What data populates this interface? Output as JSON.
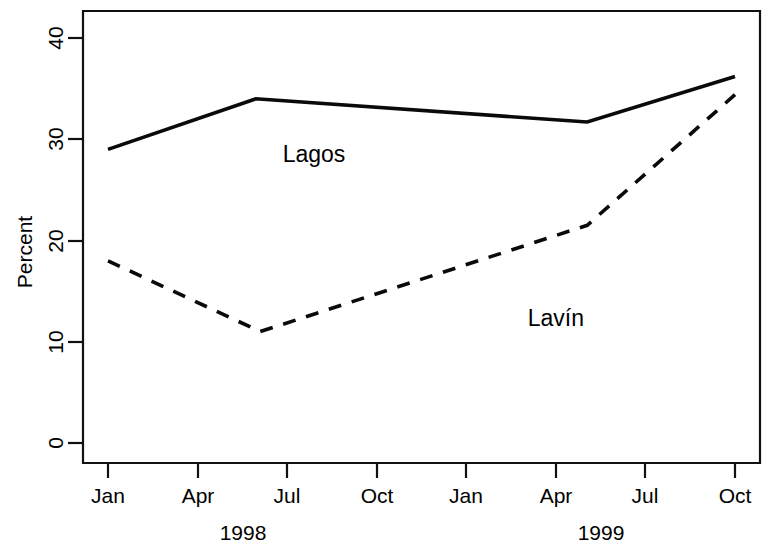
{
  "chart_data": {
    "type": "line",
    "title": "",
    "subtitle": "",
    "xlabel": "",
    "ylabel": "Percent",
    "ylim": [
      0,
      40
    ],
    "yticks": [
      0,
      10,
      20,
      30,
      40
    ],
    "ytick_labels": [
      "0",
      "10",
      "20",
      "30",
      "40"
    ],
    "x": [
      "Jan",
      "Apr",
      "Jul",
      "Oct",
      "Jan",
      "Apr",
      "Jul",
      "Oct"
    ],
    "xtick_labels": [
      "Jan",
      "Apr",
      "Jul",
      "Oct",
      "Jan",
      "Apr",
      "Jul",
      "Oct"
    ],
    "x_group_labels": [
      {
        "label": "1998",
        "center_tick_index": 1.5
      },
      {
        "label": "1999",
        "center_tick_index": 5.5
      }
    ],
    "grid": false,
    "legend": "inline-annotations",
    "series": [
      {
        "name": "Lagos",
        "style": "solid",
        "color": "#0a0a0a",
        "points": [
          {
            "x_label": "Jan 1998",
            "x_index": 0.0,
            "value": 29.0
          },
          {
            "x_label": "Jun 1998",
            "x_index": 1.65,
            "value": 34.0
          },
          {
            "x_label": "May 1999",
            "x_index": 5.35,
            "value": 31.7
          },
          {
            "x_label": "Oct 1999",
            "x_index": 7.0,
            "value": 36.2
          }
        ]
      },
      {
        "name": "Lavín",
        "style": "dashed",
        "color": "#0a0a0a",
        "points": [
          {
            "x_label": "Jan 1998",
            "x_index": 0.0,
            "value": 18.0
          },
          {
            "x_label": "Jun 1998",
            "x_index": 1.7,
            "value": 11.0
          },
          {
            "x_label": "May 1999",
            "x_index": 5.35,
            "value": 21.5
          },
          {
            "x_label": "Oct 1999",
            "x_index": 7.0,
            "value": 34.4
          }
        ]
      }
    ],
    "annotations": [
      {
        "text": "Lagos",
        "x_index": 2.3,
        "value": 27.8
      },
      {
        "text": "Lavín",
        "x_index": 5.0,
        "value": 11.6
      }
    ]
  },
  "axis": {
    "y_title": "Percent",
    "y_ticks": [
      "0",
      "10",
      "20",
      "30",
      "40"
    ],
    "x_ticks": [
      "Jan",
      "Apr",
      "Jul",
      "Oct",
      "Jan",
      "Apr",
      "Jul",
      "Oct"
    ],
    "year_1998": "1998",
    "year_1999": "1999"
  },
  "series_labels": {
    "lagos": "Lagos",
    "lavin": "Lavín"
  }
}
